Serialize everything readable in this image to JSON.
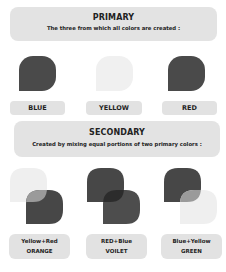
{
  "primary": {
    "title": "PRIMARY",
    "subtitle": "The three from which all colors are created :",
    "colors": [
      {
        "label": "BLUE",
        "swatch": "#4a4a4a"
      },
      {
        "label": "YELLOW",
        "swatch": "#f0f0f0"
      },
      {
        "label": "RED",
        "swatch": "#4a4a4a"
      }
    ]
  },
  "secondary": {
    "title": "SECONDARY",
    "subtitle": "Created by mixing equal portions of two primary colors :",
    "mixes": [
      {
        "formula": "Yellow+Red",
        "result": "ORANGE",
        "back": "#efefef",
        "front": "#474747",
        "overlap": "#9a9a9a"
      },
      {
        "formula": "RED+Blue",
        "result": "VOILET",
        "back": "#474747",
        "front": "#4d4d4d",
        "overlap": "#2c2c2c"
      },
      {
        "formula": "Blue+Yellow",
        "result": "GREEN",
        "back": "#474747",
        "front": "#efefef",
        "overlap": "#9a9a9a"
      }
    ]
  }
}
